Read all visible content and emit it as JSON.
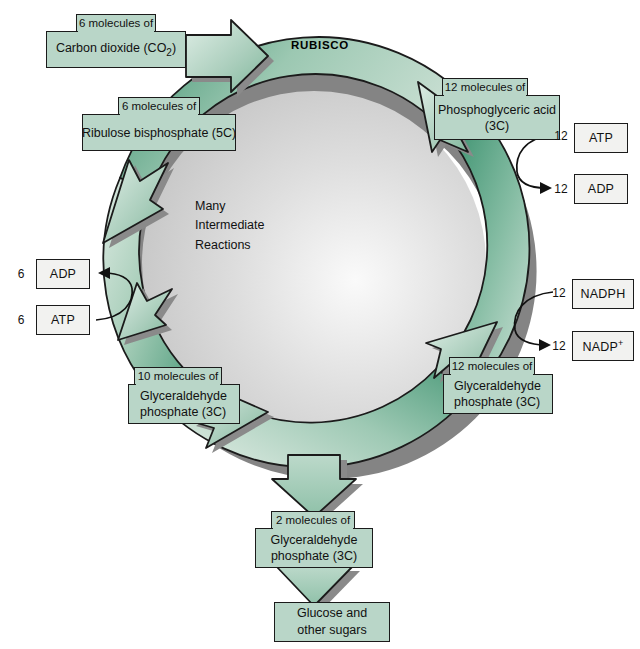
{
  "diagram": {
    "enzyme_label": "RUBISCO",
    "center_text": "Many\nIntermediate\nReactions",
    "colors": {
      "box_fill": "#b9d6c8",
      "plain_box_fill": "#f2f2f0",
      "ring_dark_green": "#3f9270",
      "ring_light_green": "#cfe2d7",
      "ring_mid_green": "#8fc0aa",
      "shadow_gray": "#7d7d7d",
      "interior_gray": "#d9d9d9",
      "outline": "#1b1b1b",
      "background": "#ffffff"
    }
  },
  "boxes": {
    "carbon_dioxide": {
      "count": "6 molecules of",
      "name": "Carbon dioxide (CO",
      "sub": "2",
      "name_tail": ")"
    },
    "ribulose": {
      "count": "6 molecules of",
      "line1": "Ribulose bisphosphate (5C)"
    },
    "pga": {
      "count": "12 molecules of",
      "line1": "Phosphoglyceric acid",
      "line2": "(3C)"
    },
    "g3p_right": {
      "count": "12 molecules of",
      "line1": "Glyceraldehyde",
      "line2": "phosphate (3C)"
    },
    "g3p_left": {
      "count": "10 molecules of",
      "line1": "Glyceraldehyde",
      "line2": "phosphate (3C)"
    },
    "g3p_out": {
      "count": "2 molecules of",
      "line1": "Glyceraldehyde",
      "line2": "phosphate (3C)"
    },
    "glucose": {
      "line1": "Glucose and",
      "line2": "other sugars"
    }
  },
  "cofactors": {
    "atp_right": {
      "coefficient": "12",
      "label": "ATP"
    },
    "adp_right": {
      "coefficient": "12",
      "label": "ADP"
    },
    "nadph": {
      "coefficient": "12",
      "label": "NADPH"
    },
    "nadp_plus": {
      "coefficient": "12",
      "label": "NADP",
      "superscript": "+"
    },
    "adp_left": {
      "coefficient": "6",
      "label": "ADP"
    },
    "atp_left": {
      "coefficient": "6",
      "label": "ATP"
    }
  }
}
